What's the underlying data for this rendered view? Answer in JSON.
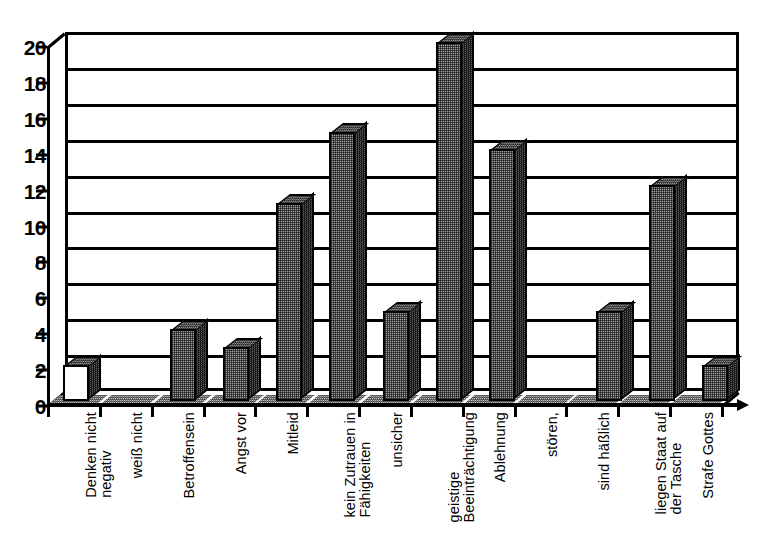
{
  "chart_data": {
    "type": "bar",
    "title": "",
    "subtitle": "",
    "xlabel": "",
    "ylabel": "",
    "ylim": [
      0,
      20
    ],
    "ytick_step": 2,
    "grid": true,
    "legend": false,
    "style": "3d-bar",
    "categories": [
      "Denken nicht negativ",
      "weiß nicht",
      "Betroffensein",
      "Angst vor",
      "Mitleid",
      "kein Zutrauen in Fähigkeiten",
      "unsicher",
      "geistige Beeinträchtigung",
      "Ablehnung",
      "stören,",
      "sind häßlich",
      "liegen Staat auf der Tasche",
      "Strafe Gottes"
    ],
    "values": [
      2,
      0,
      4,
      3,
      11,
      15,
      5,
      20,
      14,
      0,
      5,
      12,
      2
    ],
    "yticks": [
      "0",
      "2",
      "4",
      "6",
      "8",
      "10",
      "12",
      "14",
      "16",
      "18",
      "20"
    ]
  },
  "axis": {
    "y_labels": [
      "20",
      "18",
      "16",
      "14",
      "12",
      "10",
      "8",
      "6",
      "4",
      "2",
      "0"
    ]
  },
  "categories_wrapped": [
    [
      "Denken nicht",
      "negativ"
    ],
    [
      ""
    ],
    [
      "weiß nicht"
    ],
    [
      "Betroffensein"
    ],
    [
      "Angst vor"
    ],
    [
      "Mitleid"
    ],
    [
      "kein Zutrauen in",
      "Fähigkeiten"
    ],
    [
      "unsicher"
    ],
    [
      "geistige",
      "Beeinträchtigung"
    ],
    [
      "Ablehnung"
    ],
    [
      "stören,"
    ],
    [
      "sind häßlich"
    ],
    [
      "liegen Staat auf",
      "der Tasche"
    ],
    [
      "Strafe Gottes"
    ]
  ],
  "colors": {
    "bar_front": "#9d9d9d",
    "bar_side": "#626262",
    "bar_top": "#8d8d8d",
    "axis": "#000000",
    "background": "#ffffff"
  }
}
